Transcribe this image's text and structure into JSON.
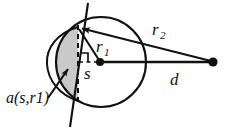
{
  "figure": {
    "type": "geometry-diagram",
    "width": 230,
    "height": 131,
    "background_color": "#ffffff",
    "stroke_color": "#111111",
    "shade_color": "#c9c9c9"
  },
  "labels": {
    "area": {
      "text": "a(s,r1)",
      "x": 6,
      "y": 103
    },
    "radius1": {
      "base": "r",
      "sub": "1",
      "x": 96,
      "y": 52
    },
    "radius2": {
      "base": "r",
      "sub": "2",
      "x": 152,
      "y": 35
    },
    "segment_height": {
      "text": "s",
      "x": 84,
      "y": 79
    },
    "distance": {
      "text": "d",
      "x": 170,
      "y": 85
    }
  },
  "geometry": {
    "circle": {
      "cx": 101,
      "cy": 62,
      "r": 45
    },
    "center_point": {
      "cx": 100,
      "cy": 62,
      "r": 4
    },
    "external_point": {
      "cx": 213,
      "cy": 62,
      "r": 4.5
    },
    "tangent_point": {
      "x": 78,
      "y": 27
    },
    "chord_top": {
      "x": 78,
      "y": 27
    },
    "chord_bottom": {
      "x": 78,
      "y": 101
    },
    "secant_line": {
      "x1": 88,
      "y1": 3,
      "x2": 70,
      "y2": 127
    },
    "shaded_cap_left_extent": 47,
    "arrow_into_cap": {
      "x1": 50,
      "y1": 95,
      "x2": 68,
      "y2": 69
    },
    "arrow_to_tangent": {
      "x1": 120,
      "y1": 34,
      "x2": 80,
      "y2": 28
    }
  },
  "elements": [
    {
      "name": "main-circle",
      "kind": "circle"
    },
    {
      "name": "shaded-circular-segment",
      "kind": "filled-region"
    },
    {
      "name": "chord-dashed-line",
      "kind": "dashed-line"
    },
    {
      "name": "sagitta-dashed-line",
      "kind": "dashed-line"
    },
    {
      "name": "right-angle-marker",
      "kind": "marker"
    },
    {
      "name": "secant-line",
      "kind": "line"
    },
    {
      "name": "radius1-line",
      "kind": "line"
    },
    {
      "name": "radius2-line",
      "kind": "line"
    },
    {
      "name": "distance-line",
      "kind": "line"
    },
    {
      "name": "circle-center-dot",
      "kind": "point"
    },
    {
      "name": "external-point-dot",
      "kind": "point"
    }
  ]
}
